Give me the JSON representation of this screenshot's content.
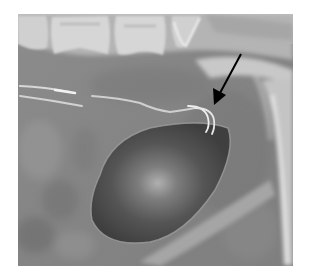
{
  "figure": {
    "type": "radiograph",
    "description": "Grayscale X-ray showing a dark oval balloon-like lucency with a curved catheter tip above it; arrow points to the catheter tip",
    "annotation": {
      "kind": "arrow",
      "color": "#000000",
      "from": [
        241,
        54
      ],
      "to": [
        214,
        104
      ],
      "label": "catheter-tip-pointer"
    },
    "structures": [
      {
        "name": "vertebral-bodies",
        "region": "top-left"
      },
      {
        "name": "pelvic-bone-arc",
        "region": "top-right / right edge"
      },
      {
        "name": "catheter-lines",
        "region": "middle-left to middle-right"
      },
      {
        "name": "balloon-lucency",
        "region": "center"
      },
      {
        "name": "diagonal-bone-band",
        "region": "bottom-right"
      }
    ],
    "colors": {
      "background": "#ffffff",
      "soft_tissue": "#8a8a8a",
      "bone": "#d8d8d8",
      "balloon": "#4a4a4a",
      "balloon_center": "#a8a8a8",
      "catheter": "#e6e6e6",
      "arrow": "#000000"
    }
  }
}
